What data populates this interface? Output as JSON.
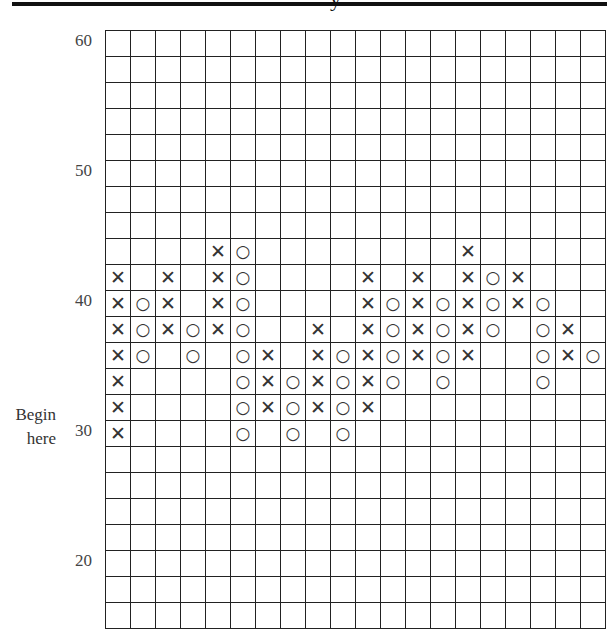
{
  "chart_data": {
    "type": "point-and-figure",
    "title": "",
    "xlabel": "",
    "ylabel": "",
    "box_size": 2,
    "ylim": [
      16,
      60
    ],
    "y_tick_labels": [
      {
        "value": 60,
        "row": 0,
        "label": "60"
      },
      {
        "value": 50,
        "row": 5,
        "label": "50"
      },
      {
        "value": 40,
        "row": 10,
        "label": "40"
      },
      {
        "value": 30,
        "row": 15,
        "label": "30"
      },
      {
        "value": 20,
        "row": 20,
        "label": "20"
      }
    ],
    "annotation": {
      "text_line1": "Begin",
      "text_line2": "here",
      "at_value": 30
    },
    "columns": 20,
    "rows": 23,
    "row_values": [
      60,
      58,
      56,
      54,
      52,
      50,
      48,
      46,
      44,
      42,
      40,
      38,
      36,
      34,
      32,
      30,
      28,
      26,
      24,
      22,
      20,
      18,
      16
    ],
    "marks": [
      {
        "row": 8,
        "X": [
          4,
          14
        ],
        "O": [
          5
        ]
      },
      {
        "row": 9,
        "X": [
          0,
          2,
          4,
          10,
          12,
          14,
          16
        ],
        "O": [
          5,
          15
        ]
      },
      {
        "row": 10,
        "X": [
          0,
          2,
          4,
          10,
          12,
          14,
          16
        ],
        "O": [
          1,
          5,
          11,
          13,
          15,
          17
        ]
      },
      {
        "row": 11,
        "X": [
          0,
          2,
          4,
          8,
          10,
          12,
          14,
          18
        ],
        "O": [
          1,
          3,
          5,
          11,
          13,
          15,
          17
        ]
      },
      {
        "row": 12,
        "X": [
          0,
          6,
          8,
          10,
          12,
          14,
          18
        ],
        "O": [
          1,
          3,
          5,
          9,
          11,
          13,
          17,
          19
        ]
      },
      {
        "row": 13,
        "X": [
          0,
          6,
          8,
          10
        ],
        "O": [
          5,
          7,
          9,
          11,
          13,
          17
        ]
      },
      {
        "row": 14,
        "X": [
          0,
          6,
          8,
          10
        ],
        "O": [
          5,
          7,
          9
        ]
      },
      {
        "row": 15,
        "X": [
          0
        ],
        "O": [
          5,
          7,
          9
        ]
      }
    ],
    "column_series": [
      {
        "col": 0,
        "type": "X",
        "from": 30,
        "to": 42
      },
      {
        "col": 1,
        "type": "O",
        "from": 40,
        "to": 36
      },
      {
        "col": 2,
        "type": "X",
        "from": 38,
        "to": 42
      },
      {
        "col": 3,
        "type": "O",
        "from": 38,
        "to": 36
      },
      {
        "col": 4,
        "type": "X",
        "from": 38,
        "to": 44
      },
      {
        "col": 5,
        "type": "O",
        "from": 44,
        "to": 30
      },
      {
        "col": 6,
        "type": "X",
        "from": 32,
        "to": 36
      },
      {
        "col": 7,
        "type": "O",
        "from": 34,
        "to": 30
      },
      {
        "col": 8,
        "type": "X",
        "from": 32,
        "to": 38
      },
      {
        "col": 9,
        "type": "O",
        "from": 36,
        "to": 30
      },
      {
        "col": 10,
        "type": "X",
        "from": 32,
        "to": 42
      },
      {
        "col": 11,
        "type": "O",
        "from": 40,
        "to": 34
      },
      {
        "col": 12,
        "type": "X",
        "from": 36,
        "to": 42
      },
      {
        "col": 13,
        "type": "O",
        "from": 40,
        "to": 34
      },
      {
        "col": 14,
        "type": "X",
        "from": 36,
        "to": 44
      },
      {
        "col": 15,
        "type": "O",
        "from": 42,
        "to": 38
      },
      {
        "col": 16,
        "type": "X",
        "from": 40,
        "to": 42
      },
      {
        "col": 17,
        "type": "O",
        "from": 40,
        "to": 34
      },
      {
        "col": 18,
        "type": "X",
        "from": 36,
        "to": 38
      },
      {
        "col": 19,
        "type": "O",
        "from": 36,
        "to": 36
      }
    ],
    "grid": true,
    "legend": null
  },
  "symbols": {
    "x": "✕",
    "o": "○"
  },
  "axis": {
    "label_60": "60",
    "label_50": "50",
    "label_40": "40",
    "label_30": "30",
    "label_20": "20"
  },
  "note": {
    "line1": "Begin",
    "line2": "here"
  },
  "header": {
    "descender_glyph": "y"
  }
}
